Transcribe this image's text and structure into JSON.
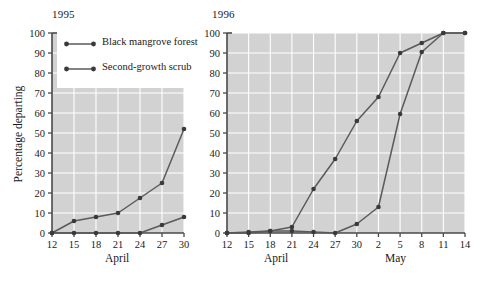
{
  "figure": {
    "ylabel": "Percentage departing",
    "legend": {
      "entries": [
        {
          "label": "Black mangrove forest",
          "color": "#5a5a5a",
          "marker": "circle"
        },
        {
          "label": "Second-growth scrub",
          "color": "#5a5a5a",
          "marker": "circle"
        }
      ]
    }
  },
  "panels": {
    "left": {
      "title": "1995",
      "xlabel": "April"
    },
    "right": {
      "title": "1996",
      "xlabel_april": "April",
      "xlabel_may": "May"
    }
  },
  "chart_data": [
    {
      "type": "line",
      "title": "1995",
      "xlabel": "April",
      "ylabel": "Percentage departing",
      "ylim": [
        0,
        100
      ],
      "yticks": [
        0,
        10,
        20,
        30,
        40,
        50,
        60,
        70,
        80,
        90,
        100
      ],
      "categories": [
        "12",
        "15",
        "18",
        "21",
        "24",
        "27",
        "30"
      ],
      "x": [
        12,
        15,
        18,
        21,
        24,
        27,
        30
      ],
      "grid": true,
      "legend_position": "upper-left-inside",
      "series": [
        {
          "name": "Black mangrove forest",
          "values": [
            0,
            6,
            8,
            10,
            17.5,
            25,
            52
          ]
        },
        {
          "name": "Second-growth scrub",
          "values": [
            0,
            0,
            0,
            0,
            0,
            4,
            8
          ]
        }
      ]
    },
    {
      "type": "line",
      "title": "1996",
      "xlabel": "April / May",
      "ylabel": "Percentage departing",
      "ylim": [
        0,
        100
      ],
      "yticks": [
        0,
        10,
        20,
        30,
        40,
        50,
        60,
        70,
        80,
        90,
        100
      ],
      "categories": [
        "12",
        "15",
        "18",
        "21",
        "24",
        "27",
        "30",
        "2",
        "5",
        "8",
        "11",
        "14"
      ],
      "x": [
        12,
        15,
        18,
        21,
        24,
        27,
        30,
        33,
        36,
        39,
        42,
        45
      ],
      "month_groups": [
        {
          "label": "April",
          "ticks": [
            "12",
            "15",
            "18",
            "21",
            "24",
            "27",
            "30"
          ]
        },
        {
          "label": "May",
          "ticks": [
            "2",
            "5",
            "8",
            "11",
            "14"
          ]
        }
      ],
      "grid": true,
      "series": [
        {
          "name": "Black mangrove forest",
          "values": [
            0,
            0,
            1,
            3,
            22,
            37,
            56,
            68,
            90,
            95,
            100,
            100
          ]
        },
        {
          "name": "Second-growth scrub",
          "values": [
            0,
            0.5,
            1,
            1,
            0.5,
            0,
            4.5,
            13,
            59.5,
            90.5,
            100,
            100
          ]
        }
      ]
    }
  ]
}
